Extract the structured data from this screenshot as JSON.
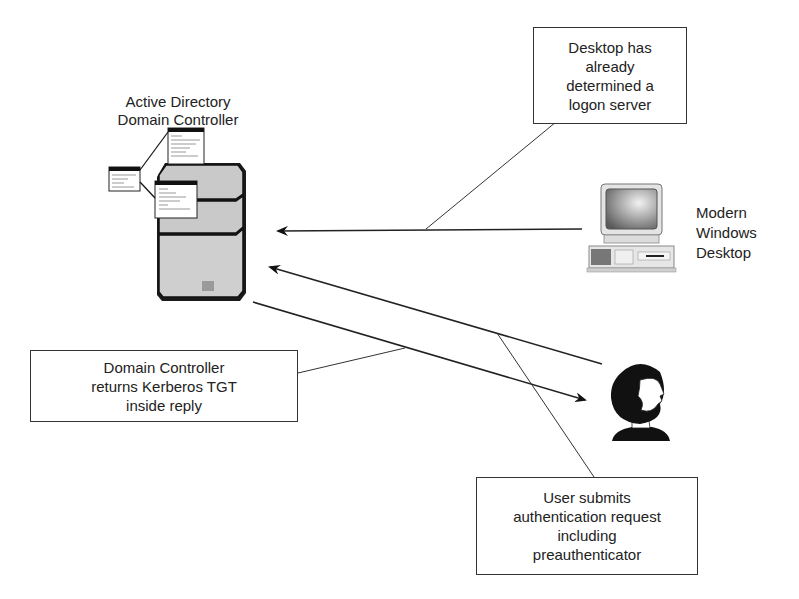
{
  "diagram": {
    "nodes": {
      "domain_controller": {
        "label_line1": "Active Directory",
        "label_line2": "Domain Controller",
        "icon": "server-tower-icon"
      },
      "desktop": {
        "label_line1": "Modern",
        "label_line2": "Windows",
        "label_line3": "Desktop",
        "icon": "desktop-computer-icon"
      },
      "user": {
        "icon": "user-person-icon"
      }
    },
    "callouts": {
      "logon_server": {
        "line1": "Desktop has",
        "line2": "already",
        "line3": "determined a",
        "line4": "logon server"
      },
      "tgt_reply": {
        "line1": "Domain Controller",
        "line2": "returns Kerberos TGT",
        "line3": "inside reply"
      },
      "auth_request": {
        "line1": "User submits",
        "line2": "authentication request",
        "line3": "including",
        "line4": "preauthenticator"
      }
    },
    "arrows": [
      {
        "from": "desktop",
        "to": "domain_controller"
      },
      {
        "from": "user",
        "to": "domain_controller"
      },
      {
        "from": "domain_controller",
        "to": "user"
      }
    ],
    "colors": {
      "line": "#2a2a2a",
      "server_fill": "#c9c9c9",
      "background": "#ffffff"
    }
  }
}
